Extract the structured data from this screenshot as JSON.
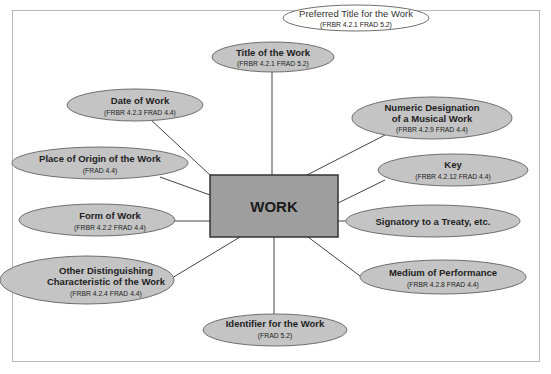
{
  "diagram": {
    "colors": {
      "ellipse_fill": "#c4c4c4",
      "ellipse_stroke": "#6e6e6e",
      "center_fill": "#9e9e9e",
      "center_stroke": "#333333",
      "line": "#444444",
      "frame": "#b8b8b8",
      "preferred_fill": "#ffffff"
    },
    "center": {
      "label": "WORK"
    },
    "nodes": {
      "preferred_title": {
        "title": "Preferred Title for the Work",
        "ref": "(FRBR 4.2.1   FRAD 5.2)"
      },
      "title": {
        "title": "Title of the Work",
        "ref": "(FRBR 4.2.1   FRAD 5.2)"
      },
      "date": {
        "title": "Date of Work",
        "ref": "(FRBR 4.2.3   FRAD 4.4)"
      },
      "numeric": {
        "title_line1": "Numeric Designation",
        "title_line2": "of a Musical Work",
        "ref": "(FRBR 4.2.9   FRAD 4.4)"
      },
      "place": {
        "title": "Place of Origin of the Work",
        "ref": "(FRAD 4.4)"
      },
      "key": {
        "title": "Key",
        "ref": "(FRBR 4.2.12   FRAD 4.4)"
      },
      "form": {
        "title": "Form of Work",
        "ref": "(FRBR 4.2.2   FRAD 4.4)"
      },
      "signatory": {
        "title": "Signatory to a Treaty, etc."
      },
      "other": {
        "title_line1": "Other Distinguishing",
        "title_line2": "Characteristic of the Work",
        "ref": "(FRBR 4.2.4   FRAD 4.4)"
      },
      "medium": {
        "title": "Medium of Performance",
        "ref": "(FRBR 4.2.8   FRAD 4.4)"
      },
      "identifier": {
        "title": "Identifier for the Work",
        "ref": "(FRAD 5.2)"
      }
    }
  }
}
